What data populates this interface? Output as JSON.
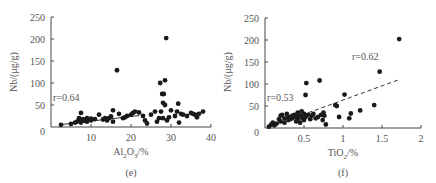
{
  "chart_data": [
    {
      "type": "scatter",
      "panel_label": "(e)",
      "title": "",
      "xlabel": "Al2O3/%",
      "xlabel_main": "Al",
      "xlabel_sub1": "2",
      "xlabel_mid": "O",
      "xlabel_sub2": "3",
      "xlabel_tail": "/%",
      "ylabel": "Nb/(μg/g)",
      "xlim": [
        0,
        40
      ],
      "ylim": [
        0,
        250
      ],
      "xticks": [
        0,
        10,
        20,
        30,
        40
      ],
      "yticks": [
        0,
        50,
        100,
        150,
        200,
        250
      ],
      "grid": false,
      "annotation": "r=0.64",
      "trendline": {
        "style": "solid",
        "x": [
          2,
          22
        ],
        "y": [
          5,
          26
        ]
      },
      "points": [
        [
          2.5,
          5
        ],
        [
          5,
          7
        ],
        [
          6,
          10
        ],
        [
          6.5,
          12
        ],
        [
          7,
          15
        ],
        [
          7,
          20
        ],
        [
          7.5,
          10
        ],
        [
          7.5,
          32
        ],
        [
          8,
          18
        ],
        [
          8.5,
          14
        ],
        [
          9,
          20
        ],
        [
          9,
          12
        ],
        [
          10,
          15
        ],
        [
          10,
          19
        ],
        [
          11,
          18
        ],
        [
          12,
          28
        ],
        [
          13,
          17
        ],
        [
          13.5,
          20
        ],
        [
          14,
          15
        ],
        [
          14.5,
          20
        ],
        [
          15,
          24
        ],
        [
          15.5,
          38
        ],
        [
          15.5,
          12
        ],
        [
          16.5,
          129
        ],
        [
          17,
          30
        ],
        [
          18,
          20
        ],
        [
          18.5,
          22
        ],
        [
          19,
          25
        ],
        [
          20,
          28
        ],
        [
          20.5,
          32
        ],
        [
          21,
          35
        ],
        [
          22,
          33
        ],
        [
          23,
          25
        ],
        [
          23.5,
          15
        ],
        [
          24,
          8
        ],
        [
          25,
          28
        ],
        [
          26,
          35
        ],
        [
          26.5,
          12
        ],
        [
          27,
          20
        ],
        [
          27.3,
          100
        ],
        [
          27.5,
          35
        ],
        [
          27.8,
          75
        ],
        [
          28,
          55
        ],
        [
          28,
          20
        ],
        [
          28.2,
          75
        ],
        [
          28.5,
          106
        ],
        [
          28.5,
          50
        ],
        [
          28.8,
          202
        ],
        [
          29,
          15
        ],
        [
          29.5,
          22
        ],
        [
          30,
          38
        ],
        [
          31,
          25
        ],
        [
          31.5,
          35
        ],
        [
          31.8,
          53
        ],
        [
          32,
          10
        ],
        [
          32.5,
          30
        ],
        [
          33,
          28
        ],
        [
          34,
          25
        ],
        [
          35,
          32
        ],
        [
          35.5,
          30
        ],
        [
          36,
          28
        ],
        [
          36.5,
          22
        ],
        [
          37,
          30
        ],
        [
          38,
          35
        ]
      ]
    },
    {
      "type": "scatter",
      "panel_label": "(f)",
      "title": "",
      "xlabel": "TiO2/%",
      "xlabel_main": "TiO",
      "xlabel_sub1": "2",
      "xlabel_tail": "/%",
      "ylabel": "Nb/(μg/g)",
      "xlim": [
        0,
        2
      ],
      "ylim": [
        0,
        250
      ],
      "xticks": [
        0.5,
        1,
        1.5,
        2
      ],
      "ytick_labels": [
        "0",
        "50",
        "100",
        "150",
        "200",
        "250"
      ],
      "yticks": [
        0,
        50,
        100,
        150,
        200,
        250
      ],
      "grid": false,
      "annotations": [
        "r=0.53",
        "r=0.62"
      ],
      "trendline": {
        "style": "dashed",
        "x": [
          0.05,
          1.72
        ],
        "y": [
          2,
          110
        ]
      },
      "points": [
        [
          0.05,
          3
        ],
        [
          0.08,
          8
        ],
        [
          0.1,
          12
        ],
        [
          0.12,
          6
        ],
        [
          0.15,
          10
        ],
        [
          0.18,
          20
        ],
        [
          0.2,
          15
        ],
        [
          0.2,
          28
        ],
        [
          0.22,
          30
        ],
        [
          0.25,
          12
        ],
        [
          0.25,
          22
        ],
        [
          0.28,
          32
        ],
        [
          0.3,
          18
        ],
        [
          0.3,
          25
        ],
        [
          0.32,
          20
        ],
        [
          0.35,
          28
        ],
        [
          0.35,
          22
        ],
        [
          0.38,
          30
        ],
        [
          0.4,
          15
        ],
        [
          0.4,
          25
        ],
        [
          0.42,
          35
        ],
        [
          0.42,
          20
        ],
        [
          0.45,
          12
        ],
        [
          0.45,
          28
        ],
        [
          0.47,
          38
        ],
        [
          0.48,
          22
        ],
        [
          0.5,
          32
        ],
        [
          0.5,
          18
        ],
        [
          0.52,
          75
        ],
        [
          0.52,
          25
        ],
        [
          0.53,
          102
        ],
        [
          0.55,
          30
        ],
        [
          0.58,
          20
        ],
        [
          0.6,
          28
        ],
        [
          0.62,
          32
        ],
        [
          0.65,
          22
        ],
        [
          0.68,
          25
        ],
        [
          0.7,
          108
        ],
        [
          0.72,
          30
        ],
        [
          0.74,
          18
        ],
        [
          0.75,
          35
        ],
        [
          0.76,
          28
        ],
        [
          0.78,
          8
        ],
        [
          0.9,
          52
        ],
        [
          0.92,
          50
        ],
        [
          0.95,
          25
        ],
        [
          1.02,
          76
        ],
        [
          1.08,
          22
        ],
        [
          1.1,
          33
        ],
        [
          1.22,
          40
        ],
        [
          1.4,
          52
        ],
        [
          1.47,
          128
        ],
        [
          1.72,
          202
        ]
      ]
    }
  ]
}
